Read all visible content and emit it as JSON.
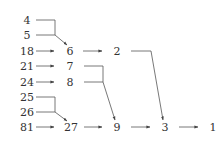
{
  "diagram": {
    "type": "merge-tree",
    "line_color": "#444444",
    "text_color": "#333333",
    "nodes": [
      {
        "id": "n4",
        "label": "4",
        "x": 27,
        "y": 21
      },
      {
        "id": "n5",
        "label": "5",
        "x": 27,
        "y": 36
      },
      {
        "id": "n18",
        "label": "18",
        "x": 27,
        "y": 52
      },
      {
        "id": "n21",
        "label": "21",
        "x": 27,
        "y": 67
      },
      {
        "id": "n24",
        "label": "24",
        "x": 27,
        "y": 83
      },
      {
        "id": "n25",
        "label": "25",
        "x": 27,
        "y": 98
      },
      {
        "id": "n26",
        "label": "26",
        "x": 27,
        "y": 113
      },
      {
        "id": "n81",
        "label": "81",
        "x": 27,
        "y": 128
      },
      {
        "id": "n6",
        "label": "6",
        "x": 70,
        "y": 52
      },
      {
        "id": "n7",
        "label": "7",
        "x": 70,
        "y": 67
      },
      {
        "id": "n8",
        "label": "8",
        "x": 70,
        "y": 83
      },
      {
        "id": "n27",
        "label": "27",
        "x": 71,
        "y": 128
      },
      {
        "id": "n2",
        "label": "2",
        "x": 117,
        "y": 52
      },
      {
        "id": "n9",
        "label": "9",
        "x": 117,
        "y": 128
      },
      {
        "id": "n3",
        "label": "3",
        "x": 165,
        "y": 128
      },
      {
        "id": "n1",
        "label": "1",
        "x": 213,
        "y": 128
      }
    ],
    "edges": [
      {
        "from": "4",
        "to": "6",
        "style": "merge"
      },
      {
        "from": "5",
        "to": "6",
        "style": "merge"
      },
      {
        "from": "18",
        "to": "6",
        "style": "straight"
      },
      {
        "from": "6",
        "to": "2",
        "style": "straight"
      },
      {
        "from": "21",
        "to": "7",
        "style": "straight"
      },
      {
        "from": "24",
        "to": "8",
        "style": "straight"
      },
      {
        "from": "7",
        "to": "9",
        "style": "merge"
      },
      {
        "from": "8",
        "to": "9",
        "style": "merge"
      },
      {
        "from": "25",
        "to": "27",
        "style": "merge"
      },
      {
        "from": "26",
        "to": "27",
        "style": "merge"
      },
      {
        "from": "81",
        "to": "27",
        "style": "straight"
      },
      {
        "from": "27",
        "to": "9",
        "style": "straight"
      },
      {
        "from": "2",
        "to": "3",
        "style": "bracket"
      },
      {
        "from": "9",
        "to": "3",
        "style": "straight"
      },
      {
        "from": "3",
        "to": "1",
        "style": "straight"
      }
    ]
  }
}
